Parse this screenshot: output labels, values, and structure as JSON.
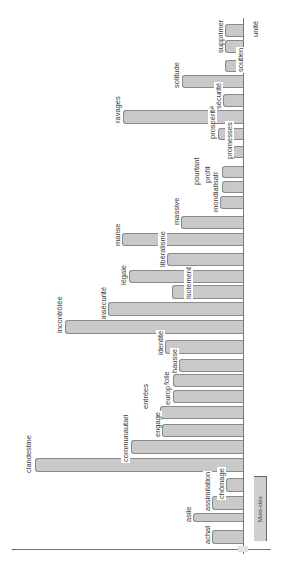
{
  "chart_data": {
    "type": "bar",
    "orientation": "rotated-90ccw (bars grow leftward from baseline)",
    "title": "",
    "xlabel": "",
    "ylabel": "",
    "grid": false,
    "legend": {
      "entries": [
        "Mots-clés"
      ],
      "position": "bottom-right"
    },
    "categories": [
      "achat",
      "asile",
      "assimilation",
      "chômage",
      "clandestine",
      "communautari",
      "engage",
      "entrées",
      "europe",
      "folle",
      "hausse",
      "identité",
      "incontrôlée",
      "insécurité",
      "isolement",
      "légale",
      "libéralisme",
      "manse",
      "massive",
      "mondialisati",
      "profit",
      "pourtant",
      "promesses",
      "prospérité",
      "ravages",
      "sécurité",
      "solitude",
      "soutien",
      "supprimer",
      "unité"
    ],
    "values": [
      31,
      50,
      31,
      17,
      208,
      112,
      81,
      83,
      70,
      70,
      64,
      78,
      178,
      135,
      71,
      114,
      76,
      121,
      62,
      23,
      21,
      21,
      10,
      25,
      120,
      20,
      61,
      18,
      18,
      18
    ]
  },
  "bars": [
    {
      "label": "achat",
      "left": 212,
      "top": 530,
      "h": 14,
      "lx": 203,
      "ly": 545
    },
    {
      "label": "asile",
      "left": 193,
      "top": 513,
      "h": 9,
      "lx": 184,
      "ly": 523
    },
    {
      "label": "assimilation",
      "left": 212,
      "top": 496,
      "h": 14,
      "lx": 203,
      "ly": 512
    },
    {
      "label": "chômage",
      "left": 226,
      "top": 478,
      "h": 14,
      "lx": 217,
      "ly": 500
    },
    {
      "label": "clandestine",
      "left": 35,
      "top": 458,
      "h": 14,
      "lx": 24,
      "ly": 474
    },
    {
      "label": "communautari",
      "left": 131,
      "top": 440,
      "h": 14,
      "lx": 121,
      "ly": 463
    },
    {
      "label": "engage",
      "left": 162,
      "top": 424,
      "h": 13,
      "lx": 153,
      "ly": 438
    },
    {
      "label": "entrées",
      "left": 160,
      "top": 406,
      "h": 13,
      "lx": 141,
      "ly": 410
    },
    {
      "label": "europe",
      "left": 173,
      "top": 390,
      "h": 13,
      "lx": 163,
      "ly": 406
    },
    {
      "label": "folle",
      "left": 173,
      "top": 374,
      "h": 13,
      "lx": 162,
      "ly": 386
    },
    {
      "label": "hausse",
      "left": 179,
      "top": 359,
      "h": 13,
      "lx": 170,
      "ly": 374
    },
    {
      "label": "identité",
      "left": 165,
      "top": 340,
      "h": 14,
      "lx": 156,
      "ly": 356
    },
    {
      "label": "incontrôlée",
      "left": 65,
      "top": 320,
      "h": 14,
      "lx": 55,
      "ly": 334
    },
    {
      "label": "insécurité",
      "left": 108,
      "top": 302,
      "h": 14,
      "lx": 99,
      "ly": 320
    },
    {
      "label": "isolement",
      "left": 172,
      "top": 285,
      "h": 14,
      "lx": 184,
      "ly": 300
    },
    {
      "label": "légale",
      "left": 129,
      "top": 270,
      "h": 13,
      "lx": 119,
      "ly": 286
    },
    {
      "label": "libéralisme",
      "left": 167,
      "top": 253,
      "h": 13,
      "lx": 158,
      "ly": 268
    },
    {
      "label": "manse",
      "left": 122,
      "top": 233,
      "h": 13,
      "lx": 113,
      "ly": 247
    },
    {
      "label": "massive",
      "left": 181,
      "top": 216,
      "h": 13,
      "lx": 172,
      "ly": 226
    },
    {
      "label": "mondialisati",
      "left": 220,
      "top": 196,
      "h": 13,
      "lx": 211,
      "ly": 213
    },
    {
      "label": "profit",
      "left": 222,
      "top": 181,
      "h": 12,
      "lx": 203,
      "ly": 184
    },
    {
      "label": "pourtant",
      "left": 222,
      "top": 166,
      "h": 12,
      "lx": 192,
      "ly": 186
    },
    {
      "label": "promesses",
      "left": 233,
      "top": 146,
      "h": 12,
      "lx": 225,
      "ly": 160
    },
    {
      "label": "prospérité",
      "left": 218,
      "top": 128,
      "h": 12,
      "lx": 208,
      "ly": 140
    },
    {
      "label": "ravages",
      "left": 123,
      "top": 110,
      "h": 14,
      "lx": 113,
      "ly": 124
    },
    {
      "label": "sécurité",
      "left": 223,
      "top": 94,
      "h": 13,
      "lx": 214,
      "ly": 110
    },
    {
      "label": "solitude",
      "left": 182,
      "top": 75,
      "h": 13,
      "lx": 172,
      "ly": 89
    },
    {
      "label": "soutien",
      "left": 225,
      "top": 60,
      "h": 12,
      "lx": 236,
      "ly": 73
    },
    {
      "label": "supprimer",
      "left": 225,
      "top": 40,
      "h": 13,
      "lx": 216,
      "ly": 54
    },
    {
      "label": "unité",
      "left": 225,
      "top": 24,
      "h": 13,
      "lx": 251,
      "ly": 38
    }
  ],
  "legend_label": "Mots-clés",
  "colors": {
    "bar_fill": "#c9c9c9",
    "bar_border": "#8a8a8a",
    "axis": "#777777",
    "text": "#3a3a3a"
  }
}
